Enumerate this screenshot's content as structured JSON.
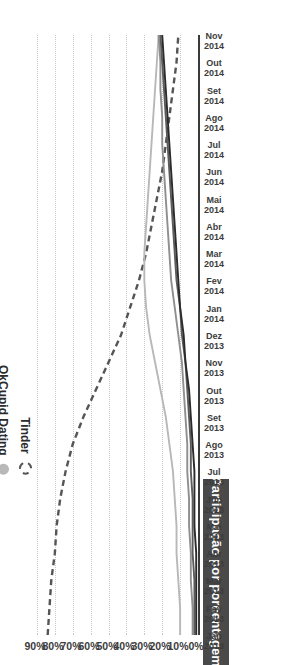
{
  "chart_data": {
    "type": "line",
    "title": "Participação por porcentagem",
    "ylabel": "Participação por porcentagem",
    "xlabel": "",
    "ylim": [
      0,
      95
    ],
    "grid": true,
    "legend_position": "center",
    "ytick_labels": [
      "0%",
      "10%",
      "20%",
      "30%",
      "40%",
      "50%",
      "60%",
      "70%",
      "80%",
      "90%"
    ],
    "ytick_values": [
      0,
      10,
      20,
      30,
      40,
      50,
      60,
      70,
      80,
      90
    ],
    "x": [
      "Jan 2013",
      "Fev 2013",
      "Mar 2013",
      "Abr 2013",
      "Mai 2013",
      "Jun 2013",
      "Jul 2013",
      "Ago 2013",
      "Set 2013",
      "Out 2013",
      "Nov 2013",
      "Dez 2013",
      "Jan 2014",
      "Fev 2014",
      "Mar 2014",
      "Abr 2014",
      "Mai 2014",
      "Jun 2014",
      "Jul 2014",
      "Ago 2014",
      "Set 2014",
      "Out 2014",
      "Nov 2014"
    ],
    "xtick_month": [
      "Jan",
      "Fev",
      "Mar",
      "Abr",
      "Mai",
      "Jun",
      "Jul",
      "Ago",
      "Set",
      "Out",
      "Nov",
      "Dez",
      "Jan",
      "Fev",
      "Mar",
      "Abr",
      "Mai",
      "Jun",
      "Jul",
      "Ago",
      "Set",
      "Out",
      "Nov"
    ],
    "xtick_year": [
      "2013",
      "2013",
      "2013",
      "2013",
      "2013",
      "2013",
      "2013",
      "2013",
      "2013",
      "2013",
      "2013",
      "2013",
      "2014",
      "2014",
      "2014",
      "2014",
      "2014",
      "2014",
      "2014",
      "2014",
      "2014",
      "2014",
      "2014"
    ],
    "series": [
      {
        "name": "Tinder",
        "color": "#555555",
        "style": "dashed",
        "values": [
          84,
          83,
          82,
          80,
          79,
          77,
          74,
          70,
          64,
          57,
          50,
          43,
          38,
          33,
          29,
          26,
          23,
          20,
          18,
          16,
          14,
          12,
          11
        ]
      },
      {
        "name": "OkCupid Dating",
        "color": "#b8b8b8",
        "style": "solid",
        "values": [
          10,
          10,
          11,
          12,
          12,
          13,
          14,
          16,
          18,
          21,
          24,
          27,
          29,
          30,
          30,
          29,
          28,
          27,
          26,
          25,
          24,
          23,
          22
        ]
      },
      {
        "name": "Zoosk",
        "color": "#8f8f8f",
        "style": "solid",
        "values": [
          3,
          3,
          4,
          4,
          5,
          5,
          6,
          6,
          7,
          8,
          9,
          11,
          13,
          15,
          16,
          17,
          18,
          19,
          20,
          20,
          21,
          21,
          22
        ]
      },
      {
        "name": "Match.com",
        "color": "#5c5c5c",
        "style": "solid",
        "values": [
          2,
          2,
          2,
          3,
          3,
          3,
          4,
          4,
          5,
          6,
          7,
          9,
          10,
          12,
          13,
          14,
          15,
          16,
          17,
          18,
          19,
          20,
          21
        ]
      },
      {
        "name": "Hinge",
        "color": "#2b2b2b",
        "style": "solid",
        "values": [
          1,
          1,
          1,
          1,
          2,
          2,
          2,
          3,
          4,
          5,
          7,
          8,
          10,
          11,
          12,
          13,
          14,
          15,
          16,
          17,
          18,
          19,
          20
        ]
      }
    ]
  }
}
